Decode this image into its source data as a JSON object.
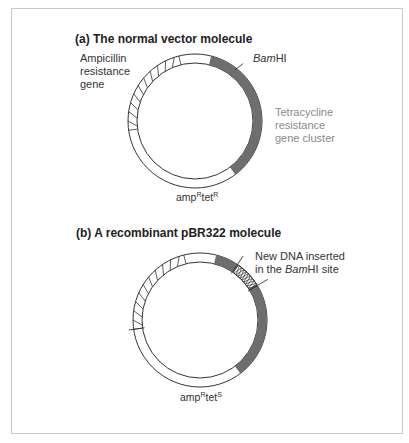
{
  "panel_a": {
    "title": "(a)  The normal vector molecule",
    "amp_label": [
      "Ampicillin",
      "resistance",
      "gene"
    ],
    "bamhi_italic": "Bam",
    "bamhi_rest": "HI",
    "tet_label": [
      "Tetracycline",
      "resistance",
      "gene cluster"
    ],
    "genotype": {
      "amp": "amp",
      "amp_sup": "R",
      "tet": "tet",
      "tet_sup": "R"
    }
  },
  "panel_b": {
    "title": "(b)  A recombinant pBR322 molecule",
    "insert_label_line1": "New DNA inserted",
    "insert_label_line2_pre": "in the ",
    "insert_label_line2_italic": "Bam",
    "insert_label_line2_post": "HI site",
    "genotype": {
      "amp": "amp",
      "amp_sup": "R",
      "tet": "tet",
      "tet_sup": "S"
    }
  },
  "colors": {
    "tet_region": "#6e6e6e",
    "outline": "#333333",
    "frame": "#c8c8c8",
    "tet_label": "#8a8a8a"
  }
}
